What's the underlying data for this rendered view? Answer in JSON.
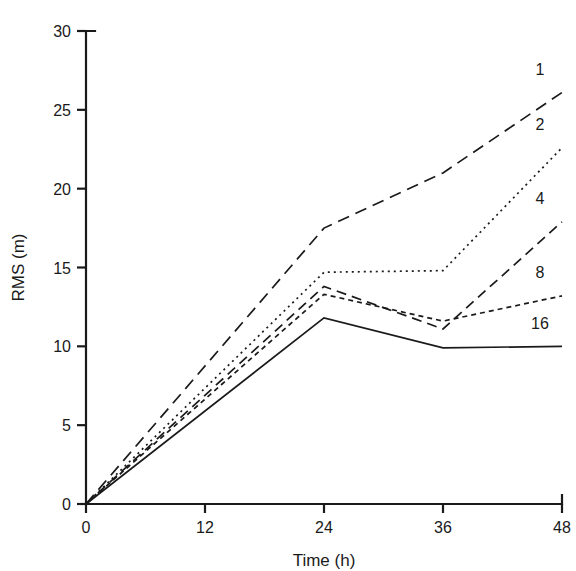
{
  "chart_data": {
    "type": "line",
    "title": "",
    "xlabel": "Time (h)",
    "ylabel": "RMS (m)",
    "xlim": [
      0,
      48
    ],
    "ylim": [
      0,
      30
    ],
    "x_ticks": [
      0,
      12,
      24,
      36,
      48
    ],
    "y_ticks": [
      0,
      5,
      10,
      15,
      20,
      25,
      30
    ],
    "x_tick_labels": [
      "0",
      "12",
      "24",
      "36",
      "48"
    ],
    "y_tick_labels": [
      "0",
      "5",
      "10",
      "15",
      "20",
      "25",
      "30"
    ],
    "grid": false,
    "legend_position": "right-inline-labels",
    "x": [
      0,
      24,
      36,
      48
    ],
    "series": [
      {
        "name": "1",
        "label": "1",
        "dash": "12,7",
        "values": [
          0,
          17.5,
          21.0,
          26.1
        ]
      },
      {
        "name": "2",
        "label": "2",
        "dash": "2,4",
        "values": [
          0,
          14.7,
          14.8,
          22.6
        ]
      },
      {
        "name": "4",
        "label": "4",
        "dash": "10,6",
        "values": [
          0,
          13.8,
          11.1,
          17.9
        ]
      },
      {
        "name": "8",
        "label": "8",
        "dash": "5,4",
        "values": [
          0,
          13.3,
          11.6,
          13.2
        ]
      },
      {
        "name": "16",
        "label": "16",
        "dash": "0",
        "values": [
          0,
          11.8,
          9.9,
          10.0
        ]
      }
    ],
    "series_label_positions": [
      {
        "label": "1",
        "x": 48,
        "y": 27.6
      },
      {
        "label": "2",
        "x": 48,
        "y": 24.1
      },
      {
        "label": "4",
        "x": 48,
        "y": 19.4
      },
      {
        "label": "8",
        "x": 48,
        "y": 14.7
      },
      {
        "label": "16",
        "x": 48,
        "y": 11.5
      }
    ],
    "line_color": "#1a1a1a",
    "background_color": "#ffffff"
  },
  "axes": {
    "x_axis_name": "Time (h)",
    "y_axis_name": "RMS (m)"
  }
}
